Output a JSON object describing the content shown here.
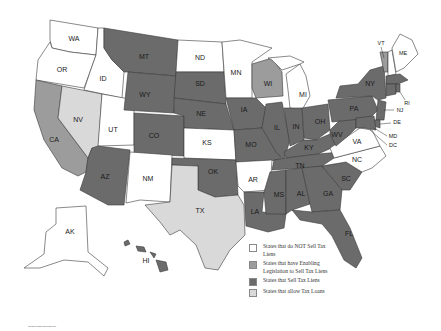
{
  "map": {
    "title": "US States Tax Lien Map",
    "colors": {
      "no_sell": "#ffffff",
      "enabling_legislation": "#9c9c9c",
      "sell": "#6b6b6b",
      "tax_loans": "#d9d9d9"
    },
    "states": [
      {
        "abbr": "WA",
        "category": "no_sell"
      },
      {
        "abbr": "OR",
        "category": "no_sell"
      },
      {
        "abbr": "ID",
        "category": "no_sell"
      },
      {
        "abbr": "MT",
        "category": "sell"
      },
      {
        "abbr": "ND",
        "category": "no_sell"
      },
      {
        "abbr": "MN",
        "category": "no_sell"
      },
      {
        "abbr": "WI",
        "category": "enabling_legislation"
      },
      {
        "abbr": "MI",
        "category": "no_sell"
      },
      {
        "abbr": "CA",
        "category": "enabling_legislation"
      },
      {
        "abbr": "NV",
        "category": "tax_loans"
      },
      {
        "abbr": "UT",
        "category": "no_sell"
      },
      {
        "abbr": "WY",
        "category": "sell"
      },
      {
        "abbr": "SD",
        "category": "sell"
      },
      {
        "abbr": "NE",
        "category": "sell"
      },
      {
        "abbr": "IA",
        "category": "sell"
      },
      {
        "abbr": "IL",
        "category": "sell"
      },
      {
        "abbr": "IN",
        "category": "sell"
      },
      {
        "abbr": "OH",
        "category": "sell"
      },
      {
        "abbr": "PA",
        "category": "sell"
      },
      {
        "abbr": "NY",
        "category": "sell"
      },
      {
        "abbr": "VT",
        "category": "enabling_legislation"
      },
      {
        "abbr": "NH",
        "category": "no_sell"
      },
      {
        "abbr": "ME",
        "category": "no_sell"
      },
      {
        "abbr": "MA",
        "category": "sell"
      },
      {
        "abbr": "CT",
        "category": "sell"
      },
      {
        "abbr": "RI",
        "category": "sell"
      },
      {
        "abbr": "NJ",
        "category": "sell"
      },
      {
        "abbr": "DE",
        "category": "sell"
      },
      {
        "abbr": "MD",
        "category": "sell"
      },
      {
        "abbr": "DC",
        "category": "sell"
      },
      {
        "abbr": "CO",
        "category": "sell"
      },
      {
        "abbr": "KS",
        "category": "no_sell"
      },
      {
        "abbr": "MO",
        "category": "sell"
      },
      {
        "abbr": "KY",
        "category": "sell"
      },
      {
        "abbr": "WV",
        "category": "sell"
      },
      {
        "abbr": "VA",
        "category": "no_sell"
      },
      {
        "abbr": "AZ",
        "category": "sell"
      },
      {
        "abbr": "NM",
        "category": "no_sell"
      },
      {
        "abbr": "OK",
        "category": "sell"
      },
      {
        "abbr": "AR",
        "category": "no_sell"
      },
      {
        "abbr": "TN",
        "category": "sell"
      },
      {
        "abbr": "NC",
        "category": "no_sell"
      },
      {
        "abbr": "SC",
        "category": "sell"
      },
      {
        "abbr": "TX",
        "category": "tax_loans"
      },
      {
        "abbr": "LA",
        "category": "sell"
      },
      {
        "abbr": "MS",
        "category": "sell"
      },
      {
        "abbr": "AL",
        "category": "sell"
      },
      {
        "abbr": "GA",
        "category": "sell"
      },
      {
        "abbr": "FL",
        "category": "sell"
      },
      {
        "abbr": "AK",
        "category": "no_sell"
      },
      {
        "abbr": "HI",
        "category": "sell"
      }
    ],
    "labels": {
      "WA": "WA",
      "OR": "OR",
      "ID": "ID",
      "MT": "MT",
      "ND": "ND",
      "MN": "MN",
      "WI": "WI",
      "MI": "MI",
      "CA": "CA",
      "NV": "NV",
      "UT": "UT",
      "WY": "WY",
      "SD": "SD",
      "NE": "NE",
      "IA": "IA",
      "IL": "IL",
      "IN": "IN",
      "OH": "OH",
      "PA": "PA",
      "NY": "NY",
      "VT": "VT",
      "ME": "ME",
      "RI": "RI",
      "NJ": "NJ",
      "DE": "DE",
      "MD": "MD",
      "DC": "DC",
      "CO": "CO",
      "KS": "KS",
      "MO": "MO",
      "KY": "KY",
      "WV": "WV",
      "VA": "VA",
      "AZ": "AZ",
      "NM": "NM",
      "OK": "OK",
      "AR": "AR",
      "TN": "TN",
      "NC": "NC",
      "SC": "SC",
      "TX": "TX",
      "LA": "LA",
      "MS": "MS",
      "AL": "AL",
      "GA": "GA",
      "FL": "FL",
      "AK": "AK",
      "HI": "HI",
      "NH": "NH",
      "MA": "MA",
      "CT": "CT"
    }
  },
  "legend": {
    "items": [
      {
        "label": "States that do NOT Sell Tax Liens",
        "color": "#ffffff"
      },
      {
        "label": "States that have Enabling Legislation to Sell Tax Liens",
        "color": "#9c9c9c"
      },
      {
        "label": "States that Sell Tax Liens",
        "color": "#6b6b6b"
      },
      {
        "label": "States that allow Tax Loans",
        "color": "#d9d9d9"
      }
    ]
  },
  "credit": "Created with mapchart.net"
}
